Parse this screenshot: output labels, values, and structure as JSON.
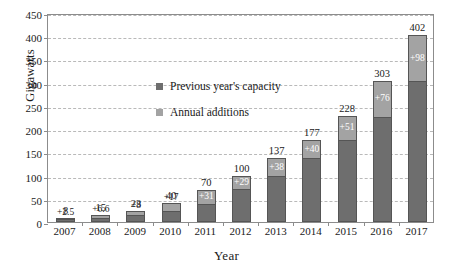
{
  "chart_data": {
    "type": "bar",
    "subtype": "stacked-bar",
    "title": "",
    "xlabel": "Year",
    "ylabel": "Gigawatts",
    "ylim": [
      0,
      450
    ],
    "ytick_step": 50,
    "ytick_labels": [
      "0",
      "50",
      "100",
      "150",
      "200",
      "250",
      "300",
      "350",
      "400",
      "450"
    ],
    "grid": true,
    "grid_style": "dashed-horizontal",
    "legend_position": "inside-upper-left",
    "categories": [
      "2007",
      "2008",
      "2009",
      "2010",
      "2011",
      "2012",
      "2013",
      "2014",
      "2015",
      "2016",
      "2017"
    ],
    "series": [
      {
        "name": "Previous year's capacity",
        "color": "#6e6e6e",
        "values": [
          5.5,
          8.4,
          15,
          23,
          39,
          71,
          99,
          137,
          177,
          227,
          304
        ]
      },
      {
        "name": "Annual additions",
        "color": "#a3a3a3",
        "values": [
          2.5,
          6.6,
          8,
          17,
          31,
          29,
          38,
          40,
          51,
          76,
          98
        ]
      }
    ],
    "totals": [
      8,
      15,
      23,
      40,
      70,
      100,
      137,
      177,
      228,
      303,
      402
    ],
    "total_labels": [
      "8",
      "15",
      "23",
      "40",
      "70",
      "100",
      "137",
      "177",
      "228",
      "303",
      "402"
    ],
    "addition_labels": [
      "+2.5",
      "+6.6",
      "+8",
      "+17",
      "+31",
      "+29",
      "+38",
      "+40",
      "+51",
      "+76",
      "+98"
    ],
    "legend": [
      {
        "label": "Previous year's capacity",
        "swatch": "base"
      },
      {
        "label": "Annual additions",
        "swatch": "add"
      }
    ]
  },
  "colors": {
    "previous_capacity": "#6e6e6e",
    "annual_additions": "#a3a3a3",
    "axis": "#8c8c8c",
    "gridline": "#b9b9b9",
    "text": "#1a1a1a"
  }
}
